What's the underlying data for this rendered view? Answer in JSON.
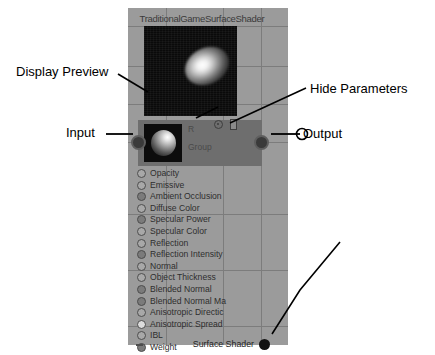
{
  "node": {
    "title": "TraditionalGameSurfaceShader",
    "header": {
      "label_r": "R",
      "label_group": "Group",
      "gear_icon": "gear-icon",
      "hide_icon": "hide-parameters-icon",
      "input_port": "input-port",
      "output_port": "output-port",
      "thumbnail": "material-sphere-thumbnail"
    },
    "preview": {
      "name": "display-preview",
      "description": "specular highlight render"
    },
    "parameters": [
      {
        "label": "Opacity",
        "state": "empty"
      },
      {
        "label": "Emissive",
        "state": "empty"
      },
      {
        "label": "Ambient Occlusion",
        "state": "filled"
      },
      {
        "label": "Diffuse Color",
        "state": "empty"
      },
      {
        "label": "Specular Power",
        "state": "filled"
      },
      {
        "label": "Specular Color",
        "state": "empty"
      },
      {
        "label": "Reflection",
        "state": "empty"
      },
      {
        "label": "Reflection Intensity",
        "state": "filled"
      },
      {
        "label": "Normal",
        "state": "empty"
      },
      {
        "label": "Object Thickness",
        "state": "empty"
      },
      {
        "label": "Blended Normal",
        "state": "filled"
      },
      {
        "label": "Blended Normal Ma",
        "state": "filled"
      },
      {
        "label": "Anisotropic Directic",
        "state": "empty"
      },
      {
        "label": "Anisotropic Spread",
        "state": "light"
      },
      {
        "label": "IBL",
        "state": "empty"
      },
      {
        "label": "Weight",
        "state": "filled"
      }
    ],
    "output": {
      "label": "Surface Shader"
    }
  },
  "annotations": {
    "display_preview": "Display Preview",
    "input": "Input",
    "output": "Output",
    "hide_parameters": "Hide Parameters"
  },
  "colors": {
    "canvas": "#9b9b9b",
    "grid": "#7c7c7c",
    "node_header": "#6e6e6e",
    "preview_bg": "#0a0a0a",
    "text": "#000000",
    "port": "#3a3a3a"
  }
}
